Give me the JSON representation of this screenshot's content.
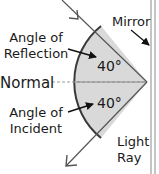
{
  "diagram": {
    "labels": {
      "mirror": "Mirror",
      "reflection_line1": "Angle of",
      "reflection_line2": "Reflection",
      "normal": "Normal",
      "incident_line1": "Angle of",
      "incident_line2": "Incident",
      "light_line1": "Light",
      "light_line2": "Ray",
      "angle_reflection": "40°",
      "angle_incident": "40°"
    },
    "colors": {
      "sector_fill": "#d9d9d9",
      "arc_stroke": "#3a3a3a",
      "ray_stroke": "#555555",
      "mirror_stroke": "#8a8a8a",
      "normal_stroke": "#9a9a9a",
      "text": "#1a1a1a"
    }
  }
}
